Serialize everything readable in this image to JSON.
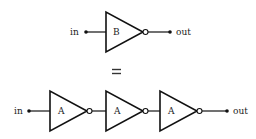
{
  "diagram": {
    "top": {
      "input_label": "in",
      "output_label": "out",
      "gate": {
        "label": "B",
        "type": "inverter"
      }
    },
    "equivalence_symbol": "=",
    "bottom": {
      "input_label": "in",
      "output_label": "out",
      "gates": [
        {
          "label": "A",
          "type": "inverter"
        },
        {
          "label": "A",
          "type": "inverter"
        },
        {
          "label": "A",
          "type": "inverter"
        }
      ]
    },
    "colors": {
      "stroke": "#111111",
      "background": "#ffffff"
    }
  }
}
